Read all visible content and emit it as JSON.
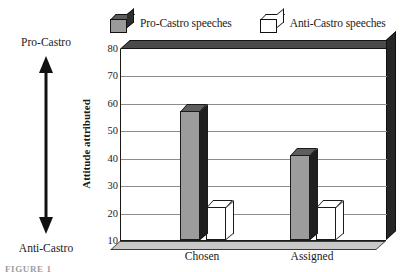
{
  "chart_data": {
    "type": "bar",
    "title": "",
    "xlabel": "",
    "ylabel": "Attitude attributed",
    "ylim": [
      10,
      80
    ],
    "yticks": [
      10,
      20,
      30,
      40,
      50,
      60,
      70,
      80
    ],
    "ytick_labels": [
      "10",
      "20",
      "30",
      "40",
      "50",
      "60",
      "70",
      "80"
    ],
    "categories": [
      "Chosen",
      "Assigned"
    ],
    "grid": true,
    "legend_position": "top",
    "style": "3d-bar",
    "series": [
      {
        "name": "Pro-Castro speeches",
        "swatch": "filled-cube",
        "color": "#9c9c9c",
        "values": [
          57,
          41
        ]
      },
      {
        "name": "Anti-Castro speeches",
        "swatch": "hollow-cube",
        "color": "#ffffff",
        "values": [
          22,
          22
        ]
      }
    ],
    "annotations": {
      "scale_top_label": "Pro-Castro",
      "scale_bottom_label": "Anti-Castro",
      "scale_arrow": "double-headed-vertical-arrow"
    }
  },
  "legend": {
    "entries": [
      {
        "label": "Pro-Castro speeches"
      },
      {
        "label": "Anti-Castro speeches"
      }
    ]
  },
  "axis": {
    "y_title": "Attitude attributed",
    "ticks": [
      "80",
      "70",
      "60",
      "50",
      "40",
      "30",
      "20",
      "10"
    ],
    "categories": [
      "Chosen",
      "Assigned"
    ]
  },
  "annotation": {
    "top": "Pro-Castro",
    "bottom": "Anti-Castro"
  },
  "caption": {
    "text": "FIGURE 1"
  },
  "colors": {
    "pro_front": "#9c9c9c",
    "pro_top": "#5e5e5e",
    "pro_side": "#1f1f1f",
    "anti_front": "#ffffff",
    "frame_top": "#4a4a4a",
    "frame_right": "#262626",
    "frame_floor": "#c8c8c8",
    "gridline": "#8c8c8c"
  }
}
